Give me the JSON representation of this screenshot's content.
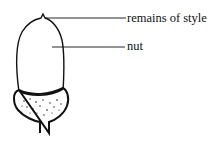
{
  "diagram": {
    "labels": [
      {
        "text": "remains of style",
        "x": 127,
        "y": 12
      },
      {
        "text": "nut",
        "x": 127,
        "y": 40
      }
    ],
    "colors": {
      "line": "#111111",
      "background": "#ffffff"
    }
  }
}
